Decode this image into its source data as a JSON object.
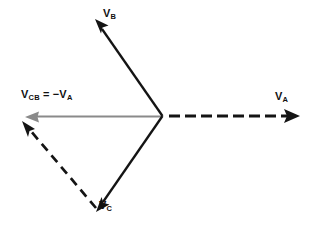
{
  "figure": {
    "type": "phasor-diagram",
    "background_color": "#ffffff",
    "width": 310,
    "height": 231,
    "colors": {
      "solid_vector": "#111111",
      "dashed_vector": "#111111",
      "resultant_vector": "#8a8a8a",
      "label_text": "#111111"
    },
    "origin": {
      "x": 162,
      "y": 116
    }
  },
  "labels": {
    "vb": {
      "symbol": "V",
      "subscript": "B"
    },
    "va": {
      "symbol": "V",
      "subscript": "A"
    },
    "vc": {
      "symbol": "V",
      "subscript": "C"
    },
    "vcb": {
      "symbol": "V",
      "subscript": "CB",
      "equals": "=",
      "minus_symbol": "−V",
      "minus_subscript": "A",
      "full_text": "V_CB = −V_A"
    }
  },
  "vectors": [
    {
      "name": "V_B",
      "label": "V_B",
      "style": "solid",
      "color": "#111111",
      "arrowhead": true,
      "start": {
        "x": 162,
        "y": 116
      },
      "end": {
        "x": 96,
        "y": 21
      },
      "angle_deg": 125,
      "width_px": 2.2
    },
    {
      "name": "V_C",
      "label": "V_C",
      "style": "solid",
      "color": "#111111",
      "arrowhead": true,
      "start": {
        "x": 162,
        "y": 116
      },
      "end": {
        "x": 97,
        "y": 210
      },
      "angle_deg": -124,
      "width_px": 2.2
    },
    {
      "name": "V_A",
      "label": "V_A",
      "style": "dashed",
      "color": "#111111",
      "arrowhead": true,
      "start": {
        "x": 168,
        "y": 116
      },
      "end": {
        "x": 299,
        "y": 116
      },
      "angle_deg": 0,
      "width_px": 2.6,
      "dash_pattern": "11 5"
    },
    {
      "name": "V_CB",
      "label": "V_CB = −V_A",
      "style": "solid",
      "color": "#8a8a8a",
      "arrowhead": true,
      "start": {
        "x": 161,
        "y": 116
      },
      "end": {
        "x": 27,
        "y": 117
      },
      "angle_deg": 180,
      "width_px": 1.8
    },
    {
      "name": "V_C-to-V_B-construction",
      "label": "",
      "style": "dashed",
      "color": "#111111",
      "arrowhead": true,
      "start": {
        "x": 97,
        "y": 209
      },
      "end": {
        "x": 24,
        "y": 122
      },
      "angle_deg": 130,
      "width_px": 2.6,
      "dash_pattern": "9 6"
    }
  ]
}
